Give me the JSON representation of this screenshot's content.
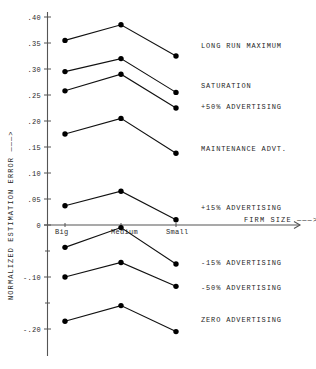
{
  "chart_data": {
    "type": "line",
    "title": "",
    "xlabel": "FIRM SIZE ———>",
    "ylabel": "NORMALIZED ESTIMATION ERROR ———>",
    "categories": [
      "Big",
      "Medium",
      "Small"
    ],
    "ylim": [
      -0.225,
      0.41
    ],
    "yticks": [
      0.4,
      0.35,
      0.3,
      0.25,
      0.2,
      0.15,
      0.1,
      0.05,
      0.0,
      -0.1,
      -0.2
    ],
    "ytick_labels": [
      ".40",
      ".35",
      ".30",
      ".25",
      ".20",
      ".15",
      ".10",
      ".05",
      "0",
      "-.10",
      "-.20"
    ],
    "minor_yticks": [
      -0.05,
      -0.15
    ],
    "grid": false,
    "legend_position": "right-inline",
    "series": [
      {
        "name": "LONG RUN MAXIMUM",
        "values": [
          0.355,
          0.385,
          0.325
        ],
        "label_y": 0.345
      },
      {
        "name": "SATURATION",
        "values": [
          0.295,
          0.32,
          0.255
        ],
        "label_y": 0.268
      },
      {
        "name": "+50% ADVERTISING",
        "values": [
          0.258,
          0.29,
          0.225
        ],
        "label_y": 0.228
      },
      {
        "name": "MAINTENANCE ADVT.",
        "values": [
          0.175,
          0.205,
          0.138
        ],
        "label_y": 0.148
      },
      {
        "name": "+15% ADVERTISING",
        "values": [
          0.037,
          0.065,
          0.01
        ],
        "label_y": 0.033
      },
      {
        "name": "-15% ADVERTISING",
        "values": [
          -0.043,
          -0.005,
          -0.075
        ],
        "label_y": -0.073
      },
      {
        "name": "-50% ADVERTISING",
        "values": [
          -0.1,
          -0.072,
          -0.118
        ],
        "label_y": -0.12
      },
      {
        "name": "ZERO ADVERTISING",
        "values": [
          -0.185,
          -0.155,
          -0.205
        ],
        "label_y": -0.182
      }
    ]
  },
  "axes": {
    "y_title": "NORMALIZED ESTIMATION ERROR ———>",
    "x_title": "FIRM SIZE ———>",
    "x_categories": [
      "Big",
      "Medium",
      "Small"
    ],
    "y_tick_labels": [
      ".40",
      ".35",
      ".30",
      ".25",
      ".20",
      ".15",
      ".10",
      ".05",
      "0",
      "-.10",
      "-.20"
    ]
  },
  "colors": {
    "line": "#111111",
    "point": "#000000",
    "axis": "#555555",
    "text": "#1f1f1f",
    "background": "#ffffff"
  }
}
